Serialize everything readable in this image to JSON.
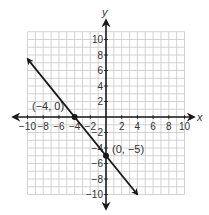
{
  "chart_data": {
    "type": "line",
    "title": "",
    "xlabel": "x",
    "ylabel": "y",
    "xlim": [
      -10,
      10
    ],
    "ylim": [
      -10,
      11
    ],
    "grid": true,
    "x_ticks": [
      -10,
      -8,
      -6,
      -4,
      -2,
      2,
      4,
      6,
      8,
      10
    ],
    "x_tick_labels": [
      "−10",
      "−8",
      "−6",
      "−4",
      "−2",
      "2",
      "4",
      "6",
      "8",
      "10"
    ],
    "y_ticks": [
      10,
      8,
      6,
      4,
      2,
      -2,
      -4,
      -6,
      -8,
      -10
    ],
    "y_tick_labels": [
      "10",
      "8",
      "6",
      "4",
      "2",
      "−2",
      "−4",
      "−6",
      "−8",
      "−10"
    ],
    "series": [
      {
        "name": "line",
        "equation": "y = -5/4 x - 5",
        "x": [
          -10,
          4
        ],
        "y": [
          7.5,
          -10
        ],
        "color": "#1a1a1a",
        "arrows": "both"
      }
    ],
    "points": [
      {
        "x": -4,
        "y": 0,
        "label": "(−4, 0)"
      },
      {
        "x": 0,
        "y": -5,
        "label": "(0, −5)"
      }
    ]
  },
  "colors": {
    "axis": "#1a1a1a",
    "grid": "#c8c8c8",
    "line": "#1a1a1a",
    "text": "#333333"
  }
}
